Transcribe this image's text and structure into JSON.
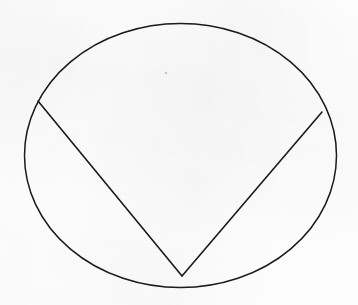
{
  "figure": {
    "background_color": "#fdfdfd",
    "ink_color": "#1a1a1a",
    "canvas": {
      "width": 358,
      "height": 305
    },
    "shapes": {
      "ellipse": {
        "name": "circle-outline",
        "cx": 180.5,
        "cy": 155.5,
        "rx": 156,
        "ry": 132,
        "stroke_width": 1.5,
        "fill": "none"
      },
      "chord_left": {
        "name": "left-chord",
        "x1": 38,
        "y1": 101,
        "x2": 182,
        "y2": 276,
        "stroke_width": 1.6
      },
      "chord_right": {
        "name": "right-chord",
        "x1": 182,
        "y1": 276,
        "x2": 322,
        "y2": 112,
        "stroke_width": 1.6
      },
      "speck": {
        "name": "scan-speck",
        "cx": 166,
        "cy": 73,
        "r": 1.1,
        "opacity": 0.45
      }
    },
    "points": [
      {
        "label": "left-intersection",
        "x": 38,
        "y": 101
      },
      {
        "label": "apex",
        "x": 182,
        "y": 276
      },
      {
        "label": "right-intersection",
        "x": 322,
        "y": 112
      }
    ]
  }
}
